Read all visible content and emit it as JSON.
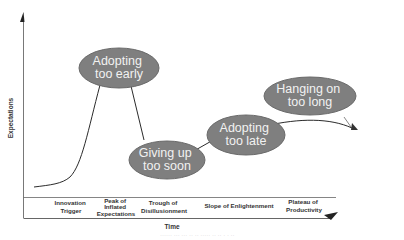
{
  "diagram": {
    "type": "hype-cycle",
    "y_axis_label": "Expectations",
    "x_axis_label": "Time",
    "phases": [
      {
        "lines": [
          "Innovation",
          "Trigger"
        ]
      },
      {
        "lines": [
          "Peak of",
          "Inflated",
          "Expectations"
        ]
      },
      {
        "lines": [
          "Trough of",
          "Disillusionment"
        ]
      },
      {
        "lines": [
          "Slope of Enlightenment"
        ]
      },
      {
        "lines": [
          "Plateau of",
          "Productivity"
        ]
      }
    ],
    "callouts": [
      {
        "lines": [
          "Adopting",
          "too early"
        ]
      },
      {
        "lines": [
          "Giving up",
          "too soon"
        ]
      },
      {
        "lines": [
          "Adopting",
          "too late"
        ]
      },
      {
        "lines": [
          "Hanging on",
          "too long"
        ]
      }
    ],
    "caption": "······ ··· ··· ·· ·· ····· ·· ·· · · ··",
    "colors": {
      "ellipse_fill": "#7f7f7f",
      "ellipse_stroke": "#6a6a6a",
      "ellipse_text": "#f2f2f2",
      "line": "#333333",
      "text": "#333333"
    }
  }
}
